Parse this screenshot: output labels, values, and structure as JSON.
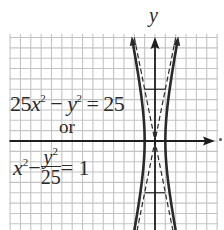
{
  "chart_data": {
    "type": "line",
    "title": "",
    "xlabel": "x",
    "ylabel": "y",
    "equation_lines": [
      "25x^2 - y^2 = 25",
      "or",
      "x^2 - y^2/25 = 1"
    ],
    "grid": true,
    "grid_unit": 1,
    "xlim": [
      -14,
      6
    ],
    "ylim": [
      -8.6,
      10.3
    ],
    "series": [
      {
        "name": "hyperbola right branch",
        "style": "solid",
        "equation": "x = sqrt(1 + y^2/25)"
      },
      {
        "name": "hyperbola left branch",
        "style": "solid",
        "equation": "x = -sqrt(1 + y^2/25)"
      },
      {
        "name": "asymptote",
        "style": "dashed",
        "equation": "y = 5x"
      },
      {
        "name": "asymptote",
        "style": "dashed",
        "equation": "y = -5x"
      }
    ],
    "vertices": [
      [
        -1,
        0
      ],
      [
        1,
        0
      ]
    ],
    "fundamental_rectangle": {
      "x": [
        -1,
        1
      ],
      "y": [
        -5,
        5
      ]
    },
    "a": 1,
    "b": 5
  },
  "labels": {
    "y_axis": "y",
    "eq1": {
      "coef": "25",
      "x": "x",
      "exp1": "2",
      "minus": " − ",
      "y": "y",
      "exp2": "2",
      "rhs": " = 25"
    },
    "or": "or",
    "eq2": {
      "x": "x",
      "exp1": "2",
      "minus": "−",
      "num_y": "y",
      "num_exp": "2",
      "den": "25",
      "rhs": "= 1"
    }
  },
  "colors": {
    "grid": "#c4c4c4",
    "axis": "#1e1e1e",
    "curve": "#2a2a2a",
    "text": "#2a2a2a",
    "background": "#ffffff"
  }
}
